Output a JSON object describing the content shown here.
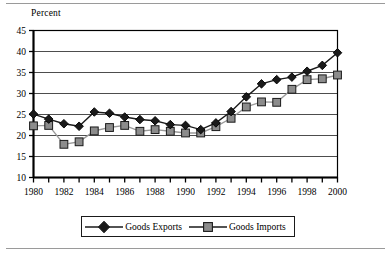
{
  "chart_data": {
    "type": "line",
    "title": "",
    "ylabel": "Percent",
    "xlabel": "",
    "ylim": [
      10,
      45
    ],
    "ytick_values": [
      45,
      40,
      35,
      30,
      25,
      20,
      15,
      10
    ],
    "ytick_labels": [
      "45",
      "40",
      "35",
      "30",
      "25",
      "20",
      "15",
      "10"
    ],
    "grid": "horizontal",
    "legend_position": "below-axes",
    "x": [
      1980,
      1981,
      1982,
      1983,
      1984,
      1985,
      1986,
      1987,
      1988,
      1989,
      1990,
      1991,
      1992,
      1993,
      1994,
      1995,
      1996,
      1997,
      1998,
      1999,
      2000
    ],
    "xtick_labels": [
      "1980",
      "1982",
      "1984",
      "1986",
      "1988",
      "1990",
      "1992",
      "1994",
      "1996",
      "1998",
      "2000"
    ],
    "xtick_values": [
      1980,
      1982,
      1984,
      1986,
      1988,
      1990,
      1992,
      1994,
      1996,
      1998,
      2000
    ],
    "series": [
      {
        "name": "Goods Exports",
        "marker": "diamond",
        "color": "#1a1a1a",
        "values": [
          25.1,
          23.9,
          22.8,
          22.2,
          25.6,
          25.3,
          24.4,
          23.8,
          23.5,
          22.6,
          22.4,
          21.4,
          23.0,
          25.7,
          29.2,
          32.3,
          33.3,
          33.9,
          35.3,
          36.7,
          39.7
        ]
      },
      {
        "name": "Goods Imports",
        "marker": "square",
        "color": "#8c8c8c",
        "values": [
          22.3,
          22.4,
          17.9,
          18.5,
          21.1,
          21.9,
          22.4,
          21.0,
          21.4,
          21.0,
          20.6,
          20.6,
          22.1,
          24.1,
          26.8,
          28.0,
          27.9,
          31.0,
          33.3,
          33.5,
          34.4
        ]
      }
    ]
  },
  "legend": {
    "items": [
      {
        "label": "Goods Exports"
      },
      {
        "label": "Goods Imports"
      }
    ]
  },
  "colors": {
    "exports": "#1a1a1a",
    "imports": "#8c8c8c",
    "gridline": "#4d4d4d",
    "axis": "#000000",
    "rule": "#9a9a9a"
  }
}
